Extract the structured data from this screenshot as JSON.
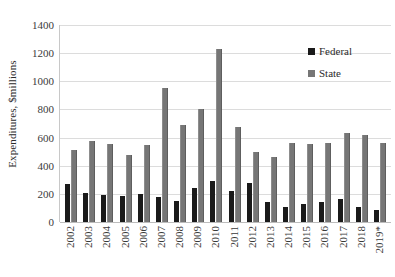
{
  "chart_data": {
    "type": "bar",
    "title": "",
    "xlabel": "",
    "ylabel": "Expenditures, $millions",
    "ylim": [
      0,
      1400
    ],
    "ytick_step": 200,
    "yticks": [
      1400,
      1200,
      1000,
      800,
      600,
      400,
      200,
      0
    ],
    "grid": true,
    "legend_position": "top-right",
    "categories": [
      "2002",
      "2003",
      "2004",
      "2005",
      "2006",
      "2007",
      "2008",
      "2009",
      "2010",
      "2011",
      "2012",
      "2013",
      "2014",
      "2015",
      "2016",
      "2017",
      "2018",
      "2019*"
    ],
    "series": [
      {
        "name": "Federal",
        "color": "#1a1a1a",
        "values": [
          270,
          205,
          195,
          185,
          200,
          180,
          150,
          240,
          295,
          220,
          275,
          145,
          110,
          130,
          140,
          165,
          110,
          85
        ]
      },
      {
        "name": "State",
        "color": "#767676",
        "values": [
          515,
          575,
          555,
          475,
          550,
          955,
          690,
          805,
          1230,
          675,
          500,
          460,
          565,
          555,
          560,
          630,
          615,
          560
        ]
      }
    ],
    "annotations": [
      "* 2019 value is an estimate, as indicated by the asterisk in the axis label"
    ]
  },
  "legend": {
    "items": [
      {
        "label": "Federal",
        "swatch": "federal-swatch"
      },
      {
        "label": "State",
        "swatch": "state-swatch"
      }
    ]
  }
}
